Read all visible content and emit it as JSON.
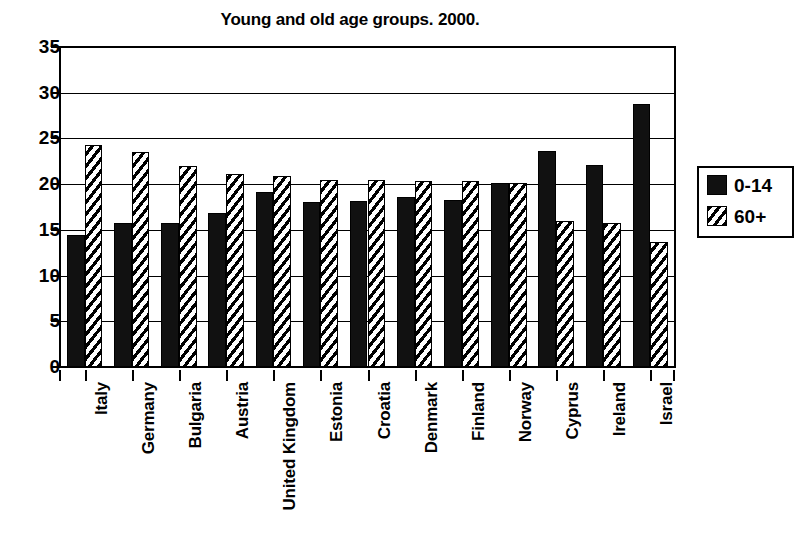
{
  "chart_data": {
    "type": "bar",
    "title": "Young and old age groups. 2000.",
    "xlabel": "",
    "ylabel": "",
    "ylim": [
      0,
      35
    ],
    "yticks": [
      0,
      5,
      10,
      15,
      20,
      25,
      30,
      35
    ],
    "grid": true,
    "legend_position": "right",
    "categories": [
      "Italy",
      "Germany",
      "Bulgaria",
      "Austria",
      "United Kingdom",
      "Estonia",
      "Croatia",
      "Denmark",
      "Finland",
      "Norway",
      "Cyprus",
      "Ireland",
      "Israel"
    ],
    "series": [
      {
        "name": "0-14",
        "pattern": "solid-black",
        "values": [
          14.4,
          15.7,
          15.8,
          16.9,
          19.1,
          18.0,
          18.2,
          18.6,
          18.3,
          20.1,
          23.6,
          22.1,
          28.8
        ]
      },
      {
        "name": "60+",
        "pattern": "diagonal-hatch",
        "values": [
          24.3,
          23.5,
          22.0,
          21.1,
          20.9,
          20.5,
          20.5,
          20.4,
          20.3,
          20.1,
          16.0,
          15.7,
          13.7
        ]
      }
    ]
  },
  "legend": {
    "entries": [
      {
        "label": "0-14"
      },
      {
        "label": "60+"
      }
    ]
  },
  "colors": {
    "young": "#111111",
    "old_fill": "#ffffff",
    "hatch": "#000000",
    "axis": "#000000",
    "background": "#ffffff"
  }
}
